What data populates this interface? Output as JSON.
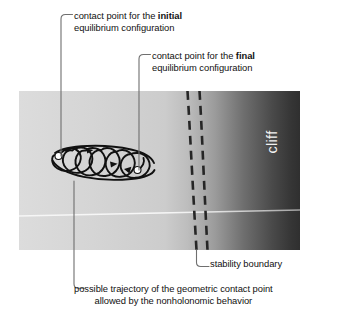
{
  "figure": {
    "panel": {
      "x": 19,
      "y": 91,
      "width": 281,
      "height": 159,
      "left_color": "#d7d7d7",
      "mid_color": "#cfcfcf",
      "right_color": "#3c3c3c",
      "horizon_line_color": "#f4f4f4"
    },
    "cliff_label": "cliff",
    "trajectory": {
      "stroke_color": "#111111",
      "loop_count": 6,
      "start_marker_color": "#ffffff",
      "end_marker_color": "#ffffff",
      "start_point": {
        "x": 58,
        "y": 156
      },
      "end_point": {
        "x": 137,
        "y": 170
      },
      "arrow_count": 3
    },
    "stability_boundary": {
      "dash_color": "#2b2b2b",
      "line_count": 2,
      "line1_x_top": 188,
      "line1_x_bottom": 196,
      "line2_x_top": 200,
      "line2_x_bottom": 207
    },
    "annotations": [
      {
        "name": "initial-contact-point",
        "line1_prefix": "contact point for the ",
        "line1_bold": "initial",
        "line2": "equilibrium configuration",
        "leader": {
          "from_x": 61,
          "from_y": 18,
          "to_x": 61,
          "to_y": 156
        }
      },
      {
        "name": "final-contact-point",
        "line1_prefix": "contact point for the ",
        "line1_bold": "final",
        "line2": "equilibrium configuration",
        "leader": {
          "from_x": 139,
          "from_y": 58,
          "to_x": 139,
          "to_y": 170
        }
      },
      {
        "name": "stability-boundary",
        "line1_prefix": "stability boundary",
        "line1_bold": "",
        "line2": "",
        "leader": {
          "from_x": 196,
          "from_y": 250,
          "to_x": 208,
          "to_y": 266
        }
      },
      {
        "name": "possible-trajectory",
        "line1_prefix": "possible trajectory of the geometric contact point",
        "line1_bold": "",
        "line2": "allowed by the nonholonomic behavior",
        "leader": {
          "from_x": 74,
          "from_y": 181,
          "to_x": 84,
          "to_y": 290
        }
      }
    ]
  }
}
